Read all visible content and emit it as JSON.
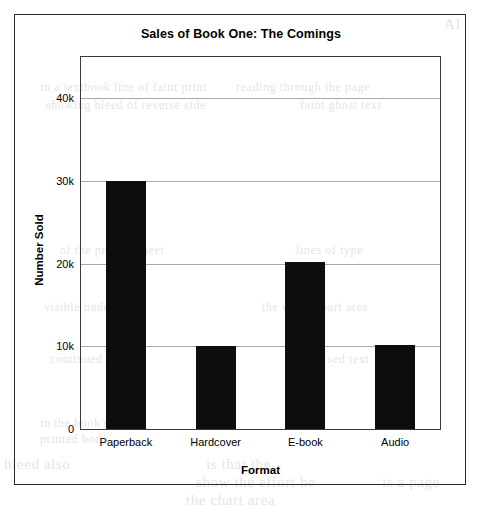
{
  "chart_data": {
    "type": "bar",
    "title": "Sales of Book One: The Comings",
    "xlabel": "Format",
    "ylabel": "Number Sold",
    "categories": [
      "Paperback",
      "Hardcover",
      "E-book",
      "Audio"
    ],
    "values": [
      30000,
      10100,
      20200,
      10200
    ],
    "series": [
      {
        "name": "Number Sold",
        "values": [
          30000,
          10100,
          20200,
          10200
        ]
      }
    ],
    "ylim": [
      0,
      45000
    ],
    "ytick_values": [
      0,
      10000,
      20000,
      30000,
      40000
    ],
    "ytick_labels": [
      "0",
      "10k",
      "20k",
      "30k",
      "40k"
    ],
    "grid": "horizontal",
    "legend": "none",
    "bar_color": "#0d0d0d",
    "grid_color": "#a8a8a8",
    "axis_color": "#3a3a3a",
    "background_color": "#ffffff"
  },
  "figure": {
    "border_color": "#2a2a2a"
  },
  "scan_artifacts": [
    {
      "text": "AI",
      "x": 444,
      "y": 16,
      "size": 15
    },
    {
      "text": "in a textbook line of faint print",
      "x": 40,
      "y": 80,
      "size": 12
    },
    {
      "text": "reading through the page",
      "x": 236,
      "y": 80,
      "size": 12
    },
    {
      "text": "showing bleed of reverse side",
      "x": 46,
      "y": 98,
      "size": 12
    },
    {
      "text": "faint ghost text",
      "x": 300,
      "y": 98,
      "size": 12
    },
    {
      "text": "of the printed sheet",
      "x": 60,
      "y": 243,
      "size": 12
    },
    {
      "text": "lines of type",
      "x": 296,
      "y": 243,
      "size": 12
    },
    {
      "text": "visible under",
      "x": 44,
      "y": 300,
      "size": 12
    },
    {
      "text": "the white chart area",
      "x": 262,
      "y": 300,
      "size": 12
    },
    {
      "text": "continued",
      "x": 50,
      "y": 352,
      "size": 12
    },
    {
      "text": "reversed text",
      "x": 300,
      "y": 352,
      "size": 12
    },
    {
      "text": "in the book's",
      "x": 40,
      "y": 416,
      "size": 12
    },
    {
      "text": "printed body",
      "x": 40,
      "y": 432,
      "size": 12
    },
    {
      "text": "is that the",
      "x": 206,
      "y": 456,
      "size": 15
    },
    {
      "text": "bleed also",
      "x": 4,
      "y": 456,
      "size": 15
    },
    {
      "text": "show the effort be",
      "x": 196,
      "y": 474,
      "size": 15
    },
    {
      "text": "is a page",
      "x": 382,
      "y": 474,
      "size": 15
    },
    {
      "text": "the chart area",
      "x": 186,
      "y": 492,
      "size": 15
    }
  ]
}
